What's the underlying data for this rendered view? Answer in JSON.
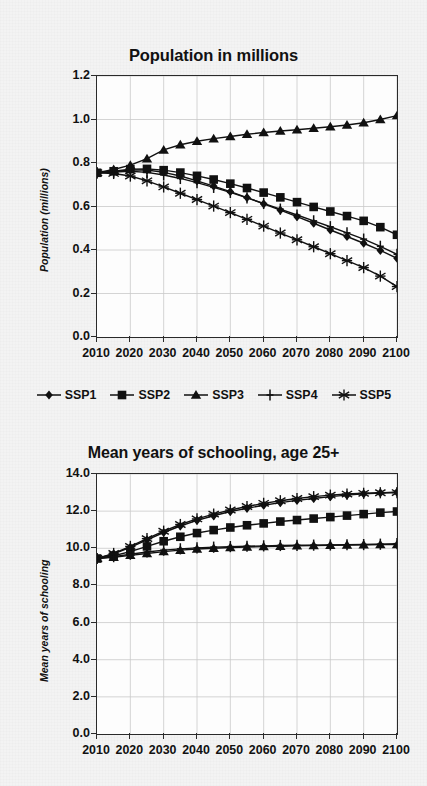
{
  "figure": {
    "background_color": "#f3f3f3",
    "ink_color": "#111111"
  },
  "legend": {
    "position": "below-top-chart",
    "items": [
      {
        "label": "SSP1",
        "marker": "diamond"
      },
      {
        "label": "SSP2",
        "marker": "square"
      },
      {
        "label": "SSP3",
        "marker": "triangle"
      },
      {
        "label": "SSP4",
        "marker": "plus"
      },
      {
        "label": "SSP5",
        "marker": "asterisk"
      }
    ]
  },
  "chart_data": [
    {
      "type": "line",
      "title": "Population in millions",
      "xlabel": "",
      "ylabel": "Population (millions)",
      "xlim": [
        2010,
        2100
      ],
      "ylim": [
        0.0,
        1.2
      ],
      "ytick_labels": [
        "0.0",
        "0.2",
        "0.4",
        "0.6",
        "0.8",
        "1.0",
        "1.2"
      ],
      "ytick_values": [
        0.0,
        0.2,
        0.4,
        0.6,
        0.8,
        1.0,
        1.2
      ],
      "xtick_labels": [
        "2010",
        "2020",
        "2030",
        "2040",
        "2050",
        "2060",
        "2070",
        "2080",
        "2090",
        "2100"
      ],
      "xtick_values": [
        2010,
        2020,
        2030,
        2040,
        2050,
        2060,
        2070,
        2080,
        2090,
        2100
      ],
      "grid": true,
      "legend_position": "bottom",
      "x": [
        2010,
        2015,
        2020,
        2025,
        2030,
        2035,
        2040,
        2045,
        2050,
        2055,
        2060,
        2065,
        2070,
        2075,
        2080,
        2085,
        2090,
        2095,
        2100
      ],
      "series": [
        {
          "name": "SSP1",
          "marker": "diamond",
          "values": [
            0.755,
            0.76,
            0.768,
            0.768,
            0.757,
            0.74,
            0.718,
            0.694,
            0.668,
            0.641,
            0.612,
            0.583,
            0.553,
            0.523,
            0.492,
            0.462,
            0.431,
            0.398,
            0.362
          ]
        },
        {
          "name": "SSP2",
          "marker": "square",
          "values": [
            0.755,
            0.762,
            0.772,
            0.773,
            0.767,
            0.756,
            0.741,
            0.724,
            0.705,
            0.685,
            0.664,
            0.642,
            0.62,
            0.598,
            0.577,
            0.556,
            0.534,
            0.505,
            0.47
          ]
        },
        {
          "name": "SSP3",
          "marker": "triangle",
          "values": [
            0.755,
            0.77,
            0.79,
            0.82,
            0.86,
            0.884,
            0.9,
            0.912,
            0.922,
            0.932,
            0.94,
            0.947,
            0.953,
            0.96,
            0.967,
            0.975,
            0.985,
            1.0,
            1.018
          ]
        },
        {
          "name": "SSP4",
          "marker": "plus",
          "values": [
            0.755,
            0.758,
            0.762,
            0.757,
            0.745,
            0.729,
            0.71,
            0.688,
            0.665,
            0.64,
            0.614,
            0.588,
            0.561,
            0.534,
            0.507,
            0.479,
            0.45,
            0.417,
            0.38
          ]
        },
        {
          "name": "SSP5",
          "marker": "asterisk",
          "values": [
            0.755,
            0.752,
            0.74,
            0.718,
            0.69,
            0.661,
            0.632,
            0.602,
            0.572,
            0.541,
            0.51,
            0.478,
            0.447,
            0.415,
            0.383,
            0.351,
            0.319,
            0.28,
            0.232
          ]
        }
      ]
    },
    {
      "type": "line",
      "title": "Mean years of schooling, age 25+",
      "xlabel": "",
      "ylabel": "Mean years of schooling",
      "xlim": [
        2010,
        2100
      ],
      "ylim": [
        0.0,
        14.0
      ],
      "ytick_labels": [
        "0.0",
        "2.0",
        "4.0",
        "6.0",
        "8.0",
        "10.0",
        "12.0",
        "14.0"
      ],
      "ytick_values": [
        0.0,
        2.0,
        4.0,
        6.0,
        8.0,
        10.0,
        12.0,
        14.0
      ],
      "xtick_labels": [
        "2010",
        "2020",
        "2030",
        "2040",
        "2050",
        "2060",
        "2070",
        "2080",
        "2090",
        "2100"
      ],
      "xtick_values": [
        2010,
        2020,
        2030,
        2040,
        2050,
        2060,
        2070,
        2080,
        2090,
        2100
      ],
      "grid": true,
      "legend_position": "none",
      "x": [
        2010,
        2015,
        2020,
        2025,
        2030,
        2035,
        2040,
        2045,
        2050,
        2055,
        2060,
        2065,
        2070,
        2075,
        2080,
        2085,
        2090,
        2095,
        2100
      ],
      "series": [
        {
          "name": "SSP1",
          "marker": "diamond",
          "values": [
            9.45,
            9.7,
            10.05,
            10.45,
            10.85,
            11.2,
            11.5,
            11.75,
            11.98,
            12.15,
            12.32,
            12.46,
            12.58,
            12.68,
            12.78,
            12.86,
            12.93,
            12.98,
            13.02
          ]
        },
        {
          "name": "SSP2",
          "marker": "square",
          "values": [
            9.45,
            9.6,
            9.82,
            10.1,
            10.38,
            10.62,
            10.82,
            10.98,
            11.12,
            11.24,
            11.34,
            11.44,
            11.52,
            11.6,
            11.68,
            11.76,
            11.84,
            11.92,
            11.98
          ]
        },
        {
          "name": "SSP3",
          "marker": "triangle",
          "values": [
            9.45,
            9.52,
            9.62,
            9.72,
            9.82,
            9.9,
            9.96,
            10.0,
            10.04,
            10.07,
            10.09,
            10.11,
            10.13,
            10.15,
            10.16,
            10.18,
            10.19,
            10.2,
            10.2
          ]
        },
        {
          "name": "SSP4",
          "marker": "plus",
          "values": [
            9.45,
            9.55,
            9.68,
            9.8,
            9.9,
            9.97,
            10.02,
            10.06,
            10.09,
            10.11,
            10.13,
            10.15,
            10.16,
            10.17,
            10.18,
            10.19,
            10.2,
            10.22,
            10.25
          ]
        },
        {
          "name": "SSP5",
          "marker": "asterisk",
          "values": [
            9.45,
            9.72,
            10.1,
            10.52,
            10.92,
            11.28,
            11.58,
            11.84,
            12.06,
            12.25,
            12.42,
            12.56,
            12.68,
            12.78,
            12.86,
            12.92,
            12.96,
            12.99,
            13.0
          ]
        }
      ]
    }
  ]
}
